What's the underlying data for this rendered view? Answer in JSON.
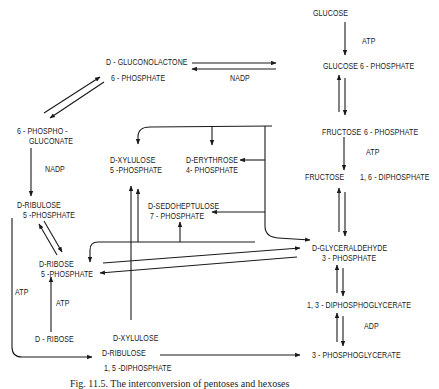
{
  "diagram": {
    "nodes": {
      "glucose": "GLUCOSE",
      "glucose6p": "GLUCOSE 6 - PHOSPHATE",
      "fructose6p_a": "FRUCTOSE",
      "fructose6p_b": "6 -  PHOSPHATE",
      "fructose16dp_a": "FRUCTOSE",
      "fructose16dp_b": "1, 6 - DIPHOSPHATE",
      "gap_1": "D-GLYCERALDEHYDE",
      "gap_2": "3 - PHOSPHATE",
      "dpg13": "1, 3 - DIPHOSPHOGLYCERATE",
      "pg3": "3 - PHOSPHOGLYCERATE",
      "gluconolactone_1": "D - GLUCONOLACTONE",
      "gluconolactone_2": "6 - PHOSPHATE",
      "phosphogluconate_1": "6 - PHOSPHO -",
      "phosphogluconate_2": "GLUCONATE",
      "ribulose5p_1": "D-RIBULOSE",
      "ribulose5p_2": "5 -PHOSPHATE",
      "ribose5p_1": "D-RIBOSE",
      "ribose5p_2": "5 -PHOSPHATE",
      "ribose": "D - RIBOSE",
      "xylulose5p_1": "D-XYLULOSE",
      "xylulose5p_2": "5 -PHOSPHATE",
      "erythrose4p_1": "D-ERYTHROSE",
      "erythrose4p_2": "4- PHOSPHATE",
      "sedoheptulose7p_1": "D-SEDOHEPTULOSE",
      "sedoheptulose7p_2": "7 - PHOSPHATE",
      "xylulose": "D-XYLULOSE",
      "ribulose15dp_1": "D-RIBULOSE",
      "ribulose15dp_2": "1, 5 -DIPHOSPHATE"
    },
    "cofactors": {
      "atp_glucose": "ATP",
      "atp_fructose": "ATP",
      "nadp_top": "NADP",
      "nadp_left": "NADP",
      "atp_ribose": "ATP",
      "atp_left": "ATP",
      "adp": "ADP"
    },
    "caption": "Fig. 11.5. The interconversion of pentoses and hexoses"
  }
}
